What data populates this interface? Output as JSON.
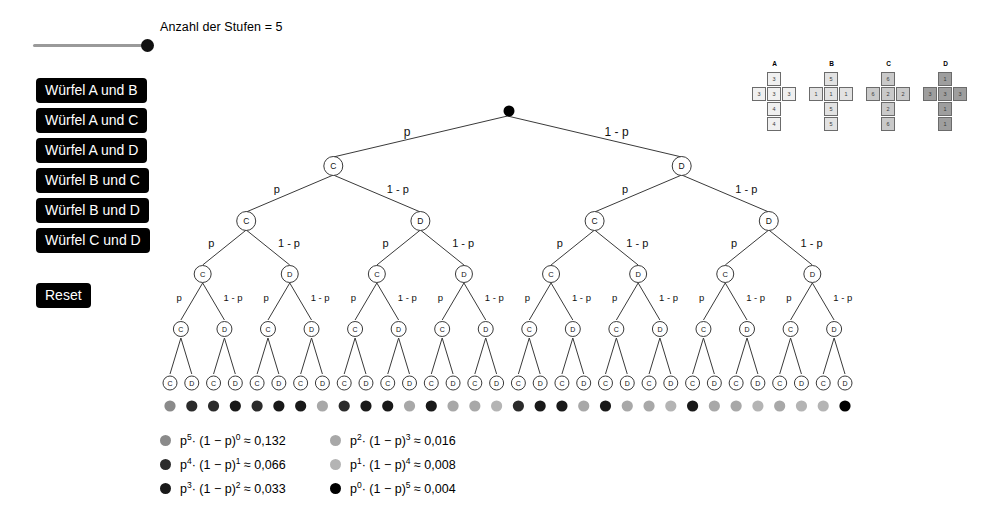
{
  "slider": {
    "label": "Anzahl der Stufen = 5",
    "value": 5,
    "min": 1,
    "max": 5
  },
  "buttons": [
    {
      "label": "Würfel A und B"
    },
    {
      "label": "Würfel A und C"
    },
    {
      "label": "Würfel A und D"
    },
    {
      "label": "Würfel B und C"
    },
    {
      "label": "Würfel B und D"
    },
    {
      "label": "Würfel C und D"
    }
  ],
  "reset_button": {
    "label": "Reset"
  },
  "dice": [
    {
      "label": "A",
      "faces": [
        "3",
        "3",
        "3",
        "3",
        "4",
        "4"
      ],
      "fill": "#f0f0f0"
    },
    {
      "label": "B",
      "faces": [
        "5",
        "1",
        "1",
        "1",
        "5",
        "5"
      ],
      "fill": "#e2e2e2"
    },
    {
      "label": "C",
      "faces": [
        "6",
        "6",
        "2",
        "2",
        "2",
        "6"
      ],
      "fill": "#c9c9c9"
    },
    {
      "label": "D",
      "faces": [
        "1",
        "3",
        "3",
        "3",
        "1",
        "1"
      ],
      "fill": "#9e9e9e"
    }
  ],
  "tree": {
    "levels": 5,
    "root_label": "",
    "left_label": "p",
    "right_label": "1 - p",
    "left_node": "C",
    "right_node": "D",
    "labeled_levels": 4,
    "leaf_count": 32
  },
  "legend": {
    "columns": [
      [
        {
          "color": "#8a8a8a",
          "p_exp": "5",
          "q_exp": "0",
          "value": "0,132"
        },
        {
          "color": "#2b2b2b",
          "p_exp": "4",
          "q_exp": "1",
          "value": "0,066"
        },
        {
          "color": "#191919",
          "p_exp": "3",
          "q_exp": "2",
          "value": "0,033"
        }
      ],
      [
        {
          "color": "#a8a8a8",
          "p_exp": "2",
          "q_exp": "3",
          "value": "0,016"
        },
        {
          "color": "#b4b4b4",
          "p_exp": "1",
          "q_exp": "4",
          "value": "0,008"
        },
        {
          "color": "#000000",
          "p_exp": "0",
          "q_exp": "5",
          "value": "0,004"
        }
      ]
    ],
    "formula_prefix": "p",
    "formula_mid": "· (1 − p)",
    "approx": "≈"
  },
  "outcome_colors": {
    "5": "#8a8a8a",
    "4": "#2b2b2b",
    "3": "#191919",
    "2": "#a8a8a8",
    "1": "#b4b4b4",
    "0": "#000000"
  },
  "colors": {
    "button_bg": "#000000",
    "button_fg": "#ffffff",
    "line": "#3a3a3a",
    "background": "#ffffff"
  }
}
